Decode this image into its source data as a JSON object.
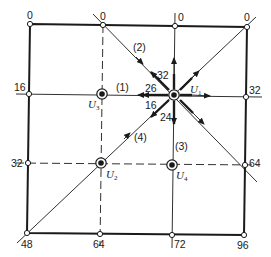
{
  "diagram": {
    "boundary_values": {
      "top_left": "0",
      "top_middle_left": "0",
      "top_middle_right": "0",
      "top_right": "0",
      "left_upper": "16",
      "left_lower": "32",
      "right_upper": "32",
      "right_lower": "64",
      "bottom_left": "48",
      "bottom_middle_left": "64",
      "bottom_middle_right": "72",
      "bottom_right": "96"
    },
    "nodes": [
      {
        "id": "U1",
        "label": "U",
        "sub": "1"
      },
      {
        "id": "U2",
        "label": "U",
        "sub": "2"
      },
      {
        "id": "U3",
        "label": "U",
        "sub": "3"
      },
      {
        "id": "U4",
        "label": "U",
        "sub": "4"
      }
    ],
    "directions": {
      "d1": "(1)",
      "d2": "(2)",
      "d3": "(3)",
      "d4": "(4)"
    },
    "arrow_values": {
      "to_left": "26",
      "to_upper_left": "32",
      "to_lower_left": "16",
      "to_down": "24"
    },
    "colors": {
      "line": "#1a1a1a",
      "background": "#ffffff"
    }
  }
}
